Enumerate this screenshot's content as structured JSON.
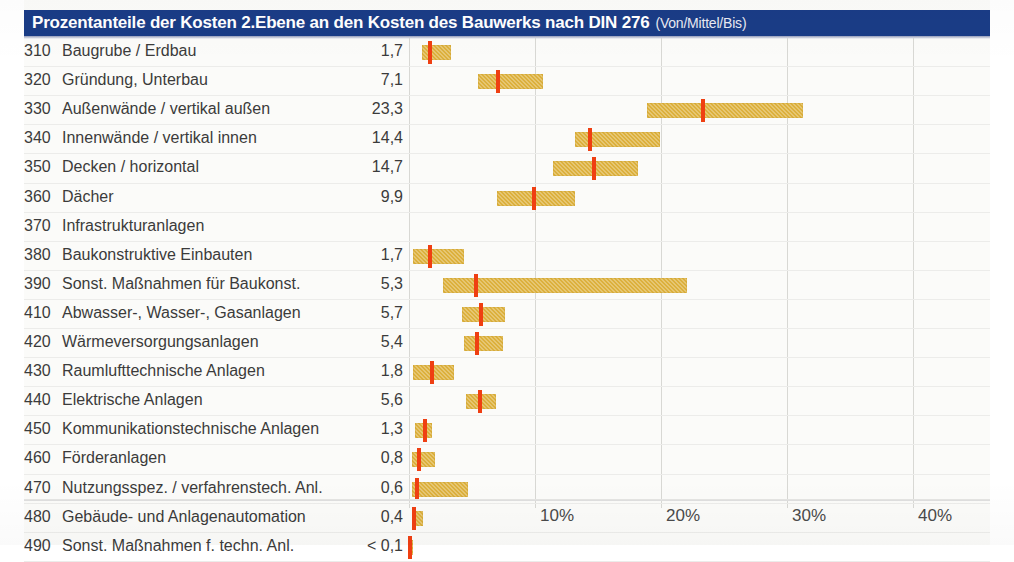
{
  "title": {
    "main": "Prozentanteile der Kosten 2.Ebene an den Kosten des Bauwerks nach DIN 276",
    "sub": "(Von/Mittel/Bis)"
  },
  "colors": {
    "header_bg": "#1a3c86",
    "header_text": "#ffffff",
    "bar": "#dcb03c",
    "mid_marker": "#ef3f12",
    "grid": "#d8d8d4",
    "text": "#3b3b3b"
  },
  "chart_data": {
    "type": "bar",
    "title": "Prozentanteile der Kosten 2.Ebene an den Kosten des Bauwerks nach DIN 276 (Von/Mittel/Bis)",
    "xlabel": "",
    "ylabel": "",
    "xlim": [
      0,
      46
    ],
    "grid": true,
    "legend": "none",
    "orientation": "horizontal",
    "value_column_header": "",
    "xticks": [
      "10%",
      "20%",
      "30%",
      "40%"
    ],
    "xtick_values": [
      10,
      20,
      30,
      40
    ],
    "categories": [
      {
        "code": "310",
        "label": "Baugrube / Erdbau",
        "value": "1,7",
        "von": 1.0,
        "mittel": 1.7,
        "bis": 3.3
      },
      {
        "code": "320",
        "label": "Gründung, Unterbau",
        "value": "7,1",
        "von": 5.5,
        "mittel": 7.1,
        "bis": 10.6
      },
      {
        "code": "330",
        "label": "Außenwände / vertikal außen",
        "value": "23,3",
        "von": 18.9,
        "mittel": 23.3,
        "bis": 31.3
      },
      {
        "code": "340",
        "label": "Innenwände / vertikal innen",
        "value": "14,4",
        "von": 13.2,
        "mittel": 14.4,
        "bis": 19.9
      },
      {
        "code": "350",
        "label": "Decken / horizontal",
        "value": "14,7",
        "von": 11.4,
        "mittel": 14.7,
        "bis": 18.2
      },
      {
        "code": "360",
        "label": "Dächer",
        "value": "9,9",
        "von": 7.0,
        "mittel": 9.9,
        "bis": 13.2
      },
      {
        "code": "370",
        "label": "Infrastrukturanlagen",
        "value": "",
        "von": null,
        "mittel": null,
        "bis": null
      },
      {
        "code": "380",
        "label": "Baukonstruktive Einbauten",
        "value": "1,7",
        "von": 0.3,
        "mittel": 1.7,
        "bis": 4.4
      },
      {
        "code": "390",
        "label": "Sonst. Maßnahmen für Baukonst.",
        "value": "5,3",
        "von": 2.7,
        "mittel": 5.3,
        "bis": 22.1
      },
      {
        "code": "410",
        "label": "Abwasser-, Wasser-, Gasanlagen",
        "value": "5,7",
        "von": 4.2,
        "mittel": 5.7,
        "bis": 7.6
      },
      {
        "code": "420",
        "label": "Wärmeversorgungsanlagen",
        "value": "5,4",
        "von": 4.4,
        "mittel": 5.4,
        "bis": 7.5
      },
      {
        "code": "430",
        "label": "Raumlufttechnische Anlagen",
        "value": "1,8",
        "von": 0.3,
        "mittel": 1.8,
        "bis": 3.6
      },
      {
        "code": "440",
        "label": "Elektrische Anlagen",
        "value": "5,6",
        "von": 4.5,
        "mittel": 5.6,
        "bis": 6.9
      },
      {
        "code": "450",
        "label": "Kommunikationstechnische Anlagen",
        "value": "1,3",
        "von": 0.5,
        "mittel": 1.3,
        "bis": 1.8
      },
      {
        "code": "460",
        "label": "Förderanlagen",
        "value": "0,8",
        "von": 0.2,
        "mittel": 0.8,
        "bis": 2.1
      },
      {
        "code": "470",
        "label": "Nutzungsspez. / verfahrenstech. Anl.",
        "value": "0,6",
        "von": 0.2,
        "mittel": 0.6,
        "bis": 4.7
      },
      {
        "code": "480",
        "label": "Gebäude- und Anlagenautomation",
        "value": "0,4",
        "von": 0.2,
        "mittel": 0.4,
        "bis": 1.1
      },
      {
        "code": "490",
        "label": "Sonst. Maßnahmen f. techn. Anl.",
        "value": "< 0,1",
        "von": 0.0,
        "mittel": 0.1,
        "bis": 0.3
      }
    ]
  }
}
